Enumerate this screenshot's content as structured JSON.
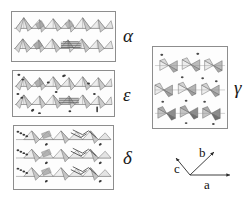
{
  "figure": {
    "type": "crystal-structure-polyhedral-diagram",
    "background_color": "#ffffff",
    "panel_border_color": "#8d8d8d",
    "line_color": "#555555",
    "fill_light": "#e8e8e8",
    "fill_mid": "#b8b8b8",
    "fill_dark": "#6e6e6e",
    "atom_color": "#3a3a3a"
  },
  "panels": [
    {
      "id": "alpha",
      "label": "α",
      "label_name": "alpha",
      "rows": 2,
      "style": "zigzag-chain",
      "has_atoms": false,
      "x": 11,
      "y": 11,
      "w": 105,
      "h": 51,
      "label_x": 123,
      "label_y": 26
    },
    {
      "id": "epsilon",
      "label": "ε",
      "label_name": "epsilon",
      "rows": 2,
      "style": "zigzag-chain",
      "has_atoms": true,
      "x": 12,
      "y": 70,
      "w": 103,
      "h": 47,
      "label_x": 123,
      "label_y": 85
    },
    {
      "id": "delta",
      "label": "δ",
      "label_name": "delta",
      "rows": 3,
      "style": "zigzag-chain",
      "has_atoms": true,
      "x": 13,
      "y": 125,
      "w": 101,
      "h": 65,
      "label_x": 123,
      "label_y": 148
    },
    {
      "id": "gamma",
      "label": "γ",
      "label_name": "gamma",
      "rows": 3,
      "style": "bowtie-pairs",
      "has_atoms": true,
      "x": 152,
      "y": 46,
      "w": 76,
      "h": 83,
      "label_x": 234,
      "label_y": 78
    }
  ],
  "axes": {
    "name": "crystallographic-axes",
    "a": "a",
    "b": "b",
    "c": "c"
  }
}
